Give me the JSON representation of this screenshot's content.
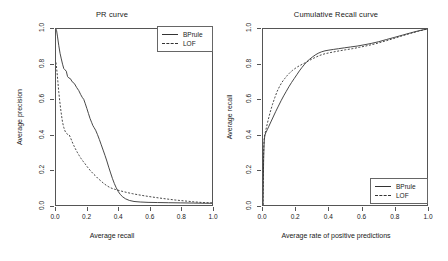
{
  "chart_data": [
    {
      "type": "line",
      "title": "PR curve",
      "xlabel": "Average recall",
      "ylabel": "Average precision",
      "xlim": [
        0.0,
        1.0
      ],
      "ylim": [
        0.0,
        1.0
      ],
      "xticks": [
        "0.0",
        "0.2",
        "0.4",
        "0.6",
        "0.8",
        "1.0"
      ],
      "yticks": [
        "0.0",
        "0.2",
        "0.4",
        "0.6",
        "0.8",
        "1.0"
      ],
      "grid": false,
      "legend_position": "top-right",
      "series": [
        {
          "name": "BPrule",
          "style": "solid",
          "color": "#333333",
          "points": [
            [
              0.0,
              1.0
            ],
            [
              0.004,
              0.99
            ],
            [
              0.01,
              0.955
            ],
            [
              0.018,
              0.905
            ],
            [
              0.026,
              0.862
            ],
            [
              0.034,
              0.83
            ],
            [
              0.042,
              0.8
            ],
            [
              0.05,
              0.775
            ],
            [
              0.058,
              0.768
            ],
            [
              0.066,
              0.76
            ],
            [
              0.074,
              0.73
            ],
            [
              0.082,
              0.722
            ],
            [
              0.092,
              0.718
            ],
            [
              0.104,
              0.7
            ],
            [
              0.118,
              0.69
            ],
            [
              0.132,
              0.668
            ],
            [
              0.146,
              0.65
            ],
            [
              0.158,
              0.628
            ],
            [
              0.168,
              0.612
            ],
            [
              0.178,
              0.6
            ],
            [
              0.188,
              0.575
            ],
            [
              0.198,
              0.548
            ],
            [
              0.208,
              0.52
            ],
            [
              0.218,
              0.492
            ],
            [
              0.228,
              0.47
            ],
            [
              0.236,
              0.452
            ],
            [
              0.244,
              0.44
            ],
            [
              0.254,
              0.425
            ],
            [
              0.266,
              0.4
            ],
            [
              0.278,
              0.372
            ],
            [
              0.29,
              0.342
            ],
            [
              0.302,
              0.312
            ],
            [
              0.314,
              0.282
            ],
            [
              0.326,
              0.25
            ],
            [
              0.338,
              0.215
            ],
            [
              0.35,
              0.182
            ],
            [
              0.362,
              0.15
            ],
            [
              0.374,
              0.122
            ],
            [
              0.386,
              0.098
            ],
            [
              0.398,
              0.078
            ],
            [
              0.412,
              0.06
            ],
            [
              0.428,
              0.046
            ],
            [
              0.446,
              0.035
            ],
            [
              0.47,
              0.026
            ],
            [
              0.5,
              0.02
            ],
            [
              0.54,
              0.017
            ],
            [
              0.59,
              0.015
            ],
            [
              0.65,
              0.014
            ],
            [
              0.72,
              0.013
            ],
            [
              0.8,
              0.012
            ],
            [
              0.88,
              0.011
            ],
            [
              0.95,
              0.01
            ],
            [
              1.0,
              0.01
            ]
          ]
        },
        {
          "name": "LOF",
          "style": "dashed",
          "color": "#333333",
          "points": [
            [
              0.0,
              0.81
            ],
            [
              0.006,
              0.76
            ],
            [
              0.012,
              0.7
            ],
            [
              0.018,
              0.64
            ],
            [
              0.024,
              0.59
            ],
            [
              0.03,
              0.545
            ],
            [
              0.036,
              0.505
            ],
            [
              0.042,
              0.47
            ],
            [
              0.05,
              0.44
            ],
            [
              0.058,
              0.42
            ],
            [
              0.066,
              0.408
            ],
            [
              0.074,
              0.402
            ],
            [
              0.084,
              0.4
            ],
            [
              0.094,
              0.38
            ],
            [
              0.104,
              0.358
            ],
            [
              0.114,
              0.338
            ],
            [
              0.124,
              0.32
            ],
            [
              0.136,
              0.3
            ],
            [
              0.148,
              0.282
            ],
            [
              0.16,
              0.265
            ],
            [
              0.174,
              0.248
            ],
            [
              0.188,
              0.232
            ],
            [
              0.202,
              0.215
            ],
            [
              0.218,
              0.198
            ],
            [
              0.234,
              0.182
            ],
            [
              0.25,
              0.168
            ],
            [
              0.268,
              0.152
            ],
            [
              0.286,
              0.138
            ],
            [
              0.304,
              0.124
            ],
            [
              0.322,
              0.112
            ],
            [
              0.34,
              0.102
            ],
            [
              0.36,
              0.094
            ],
            [
              0.382,
              0.088
            ],
            [
              0.406,
              0.082
            ],
            [
              0.432,
              0.076
            ],
            [
              0.46,
              0.07
            ],
            [
              0.492,
              0.064
            ],
            [
              0.528,
              0.058
            ],
            [
              0.568,
              0.052
            ],
            [
              0.612,
              0.046
            ],
            [
              0.66,
              0.04
            ],
            [
              0.712,
              0.034
            ],
            [
              0.768,
              0.028
            ],
            [
              0.826,
              0.023
            ],
            [
              0.884,
              0.018
            ],
            [
              0.94,
              0.014
            ],
            [
              1.0,
              0.012
            ]
          ]
        }
      ]
    },
    {
      "type": "line",
      "title": "Cumulative Recall curve",
      "xlabel": "Average rate of positive predictions",
      "ylabel": "Average recall",
      "xlim": [
        0.0,
        1.0
      ],
      "ylim": [
        0.0,
        1.0
      ],
      "xticks": [
        "0.0",
        "0.2",
        "0.4",
        "0.6",
        "0.8",
        "1.0"
      ],
      "yticks": [
        "0.0",
        "0.2",
        "0.4",
        "0.6",
        "0.8",
        "1.0"
      ],
      "grid": false,
      "legend_position": "bottom-right",
      "series": [
        {
          "name": "BPrule",
          "style": "solid",
          "color": "#333333",
          "points": [
            [
              0.0,
              0.0
            ],
            [
              0.002,
              0.14
            ],
            [
              0.004,
              0.265
            ],
            [
              0.006,
              0.335
            ],
            [
              0.008,
              0.372
            ],
            [
              0.012,
              0.398
            ],
            [
              0.018,
              0.412
            ],
            [
              0.026,
              0.428
            ],
            [
              0.036,
              0.448
            ],
            [
              0.048,
              0.472
            ],
            [
              0.062,
              0.5
            ],
            [
              0.078,
              0.532
            ],
            [
              0.094,
              0.562
            ],
            [
              0.11,
              0.592
            ],
            [
              0.126,
              0.62
            ],
            [
              0.142,
              0.646
            ],
            [
              0.158,
              0.672
            ],
            [
              0.174,
              0.696
            ],
            [
              0.19,
              0.718
            ],
            [
              0.206,
              0.74
            ],
            [
              0.222,
              0.762
            ],
            [
              0.238,
              0.782
            ],
            [
              0.254,
              0.8
            ],
            [
              0.268,
              0.815
            ],
            [
              0.284,
              0.828
            ],
            [
              0.3,
              0.84
            ],
            [
              0.318,
              0.852
            ],
            [
              0.336,
              0.862
            ],
            [
              0.356,
              0.87
            ],
            [
              0.378,
              0.876
            ],
            [
              0.402,
              0.88
            ],
            [
              0.43,
              0.884
            ],
            [
              0.46,
              0.888
            ],
            [
              0.496,
              0.893
            ],
            [
              0.534,
              0.898
            ],
            [
              0.574,
              0.903
            ],
            [
              0.616,
              0.91
            ],
            [
              0.66,
              0.918
            ],
            [
              0.706,
              0.928
            ],
            [
              0.752,
              0.94
            ],
            [
              0.8,
              0.952
            ],
            [
              0.85,
              0.965
            ],
            [
              0.9,
              0.978
            ],
            [
              0.95,
              0.99
            ],
            [
              1.0,
              1.0
            ]
          ]
        },
        {
          "name": "LOF",
          "style": "dashed",
          "color": "#333333",
          "points": [
            [
              0.0,
              0.0
            ],
            [
              0.002,
              0.18
            ],
            [
              0.004,
              0.3
            ],
            [
              0.006,
              0.358
            ],
            [
              0.009,
              0.39
            ],
            [
              0.014,
              0.412
            ],
            [
              0.022,
              0.445
            ],
            [
              0.032,
              0.485
            ],
            [
              0.044,
              0.528
            ],
            [
              0.058,
              0.572
            ],
            [
              0.072,
              0.61
            ],
            [
              0.086,
              0.645
            ],
            [
              0.1,
              0.672
            ],
            [
              0.116,
              0.698
            ],
            [
              0.132,
              0.718
            ],
            [
              0.148,
              0.736
            ],
            [
              0.164,
              0.752
            ],
            [
              0.18,
              0.765
            ],
            [
              0.196,
              0.776
            ],
            [
              0.212,
              0.786
            ],
            [
              0.228,
              0.794
            ],
            [
              0.244,
              0.802
            ],
            [
              0.262,
              0.81
            ],
            [
              0.28,
              0.82
            ],
            [
              0.3,
              0.83
            ],
            [
              0.322,
              0.84
            ],
            [
              0.346,
              0.85
            ],
            [
              0.372,
              0.858
            ],
            [
              0.4,
              0.864
            ],
            [
              0.432,
              0.87
            ],
            [
              0.466,
              0.876
            ],
            [
              0.504,
              0.882
            ],
            [
              0.544,
              0.888
            ],
            [
              0.588,
              0.896
            ],
            [
              0.634,
              0.905
            ],
            [
              0.682,
              0.915
            ],
            [
              0.732,
              0.928
            ],
            [
              0.784,
              0.942
            ],
            [
              0.838,
              0.958
            ],
            [
              0.892,
              0.973
            ],
            [
              0.946,
              0.987
            ],
            [
              1.0,
              1.0
            ]
          ]
        }
      ]
    }
  ],
  "legend": {
    "bprule_label": "BPrule",
    "lof_label": "LOF"
  }
}
